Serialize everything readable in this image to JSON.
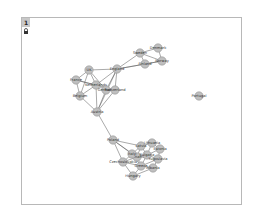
{
  "toolbar": {
    "tab_label": "1",
    "lock_icon": "lock-icon"
  },
  "graph": {
    "nodes": [
      {
        "id": "Denmark",
        "x": 158,
        "y": 48
      },
      {
        "id": "Sweden",
        "x": 140,
        "y": 53
      },
      {
        "id": "Norway",
        "x": 162,
        "y": 61
      },
      {
        "id": "Finland",
        "x": 145,
        "y": 64
      },
      {
        "id": "England",
        "x": 117,
        "y": 69
      },
      {
        "id": "UK",
        "x": 89,
        "y": 70
      },
      {
        "id": "France",
        "x": 76,
        "y": 80
      },
      {
        "id": "Netherlands",
        "x": 96,
        "y": 85
      },
      {
        "id": "Germany",
        "x": 106,
        "y": 90
      },
      {
        "id": "Switzerland",
        "x": 115,
        "y": 90
      },
      {
        "id": "Belgium",
        "x": 80,
        "y": 96
      },
      {
        "id": "Austria",
        "x": 97,
        "y": 112
      },
      {
        "id": "Portugal",
        "x": 199,
        "y": 96
      },
      {
        "id": "Poland",
        "x": 113,
        "y": 140
      },
      {
        "id": "Czechoslovakia",
        "x": 123,
        "y": 162
      },
      {
        "id": "Hungary",
        "x": 133,
        "y": 176
      },
      {
        "id": "Lithuania",
        "x": 152,
        "y": 143
      },
      {
        "id": "Latvia",
        "x": 141,
        "y": 146
      },
      {
        "id": "Estonia",
        "x": 160,
        "y": 149
      },
      {
        "id": "Romania",
        "x": 137,
        "y": 157
      },
      {
        "id": "Bulgaria",
        "x": 147,
        "y": 155
      },
      {
        "id": "Yugoslavia",
        "x": 158,
        "y": 159
      },
      {
        "id": "Greece",
        "x": 141,
        "y": 166
      },
      {
        "id": "Albania",
        "x": 153,
        "y": 168
      },
      {
        "id": "Italy",
        "x": 132,
        "y": 154
      }
    ],
    "edges": [
      [
        "Denmark",
        "Sweden"
      ],
      [
        "Denmark",
        "Norway"
      ],
      [
        "Sweden",
        "Norway"
      ],
      [
        "Sweden",
        "Finland"
      ],
      [
        "Finland",
        "Norway"
      ],
      [
        "Sweden",
        "England"
      ],
      [
        "Finland",
        "England"
      ],
      [
        "Norway",
        "England"
      ],
      [
        "England",
        "UK"
      ],
      [
        "England",
        "Netherlands"
      ],
      [
        "England",
        "Germany"
      ],
      [
        "England",
        "Switzerland"
      ],
      [
        "England",
        "Austria"
      ],
      [
        "UK",
        "France"
      ],
      [
        "UK",
        "Netherlands"
      ],
      [
        "UK",
        "Belgium"
      ],
      [
        "UK",
        "Germany"
      ],
      [
        "France",
        "Netherlands"
      ],
      [
        "France",
        "Belgium"
      ],
      [
        "France",
        "Switzerland"
      ],
      [
        "Netherlands",
        "Germany"
      ],
      [
        "Netherlands",
        "Belgium"
      ],
      [
        "Germany",
        "Switzerland"
      ],
      [
        "Germany",
        "Austria"
      ],
      [
        "Belgium",
        "Austria"
      ],
      [
        "Switzerland",
        "Austria"
      ],
      [
        "Netherlands",
        "Austria"
      ],
      [
        "Austria",
        "Poland"
      ],
      [
        "Poland",
        "Czechoslovakia"
      ],
      [
        "Poland",
        "Latvia"
      ],
      [
        "Poland",
        "Italy"
      ],
      [
        "Poland",
        "Romania"
      ],
      [
        "Czechoslovakia",
        "Hungary"
      ],
      [
        "Czechoslovakia",
        "Italy"
      ],
      [
        "Czechoslovakia",
        "Greece"
      ],
      [
        "Czechoslovakia",
        "Romania"
      ],
      [
        "Hungary",
        "Greece"
      ],
      [
        "Hungary",
        "Albania"
      ],
      [
        "Lithuania",
        "Latvia"
      ],
      [
        "Lithuania",
        "Estonia"
      ],
      [
        "Lithuania",
        "Bulgaria"
      ],
      [
        "Latvia",
        "Romania"
      ],
      [
        "Latvia",
        "Italy"
      ],
      [
        "Estonia",
        "Yugoslavia"
      ],
      [
        "Estonia",
        "Bulgaria"
      ],
      [
        "Romania",
        "Bulgaria"
      ],
      [
        "Romania",
        "Greece"
      ],
      [
        "Bulgaria",
        "Yugoslavia"
      ],
      [
        "Bulgaria",
        "Greece"
      ],
      [
        "Yugoslavia",
        "Albania"
      ],
      [
        "Greece",
        "Albania"
      ],
      [
        "Italy",
        "Romania"
      ],
      [
        "Italy",
        "Greece"
      ],
      [
        "Latvia",
        "Bulgaria"
      ],
      [
        "Yugoslavia",
        "Greece"
      ]
    ]
  }
}
